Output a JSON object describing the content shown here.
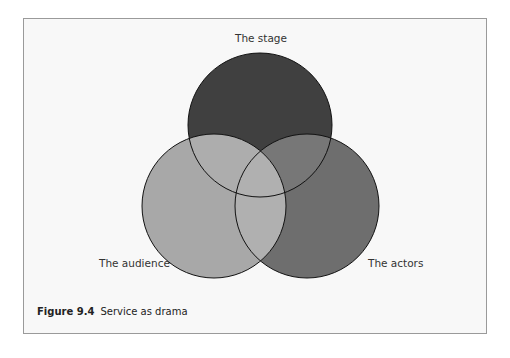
{
  "figure": {
    "number": "Figure 9.4",
    "title": "Service as drama"
  },
  "diagram": {
    "type": "venn",
    "circles": [
      {
        "id": "stage",
        "label": "The stage",
        "cx": 260,
        "cy": 125,
        "r": 72,
        "fill": "#404040"
      },
      {
        "id": "audience",
        "label": "The audience",
        "cx": 214,
        "cy": 206,
        "r": 72,
        "fill": "#a8a8a8"
      },
      {
        "id": "actors",
        "label": "The actors",
        "cx": 307,
        "cy": 206,
        "r": 72,
        "fill": "#6e6e6e"
      }
    ],
    "overlaps": {
      "stage_audience": "#adadad",
      "stage_actors": "#777777",
      "audience_actors": "#b0b0b0",
      "all": "#b0b0b0"
    },
    "stroke": "#111111",
    "frame_border": "#9a9a9a",
    "background": "#f8f8f8"
  }
}
